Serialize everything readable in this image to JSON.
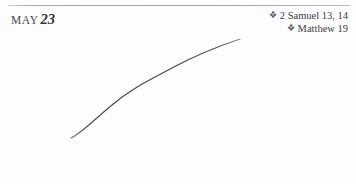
{
  "page": {
    "background_color": "#fdfdfd",
    "rule_color": "#b9b9bb"
  },
  "header": {
    "month": "MAY",
    "day": "23"
  },
  "readings": {
    "bullet_glyph": "❖",
    "bullet_icon_name": "floret-bullet-icon",
    "items": [
      {
        "label": "2 Samuel 13, 14"
      },
      {
        "label": "Matthew 19"
      }
    ]
  },
  "figure": {
    "name": "hand-drawn-ascending-curve",
    "stroke_color": "#55555c",
    "start_point": [
      71,
      138
    ],
    "end_point": [
      240,
      39
    ],
    "path": "M71,138 C83,132 96,118 112,105 C132,88 150,80 172,68 C196,55 222,45 240,39"
  }
}
